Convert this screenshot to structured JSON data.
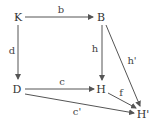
{
  "diagram": {
    "type": "commutative-diagram",
    "nodes": [
      {
        "id": "K",
        "label": "K"
      },
      {
        "id": "B",
        "label": "B"
      },
      {
        "id": "D",
        "label": "D"
      },
      {
        "id": "H",
        "label": "H"
      },
      {
        "id": "H_prime",
        "label": "H'"
      }
    ],
    "edges": [
      {
        "from": "K",
        "to": "B",
        "label": "b"
      },
      {
        "from": "K",
        "to": "D",
        "label": "d"
      },
      {
        "from": "B",
        "to": "H",
        "label": "h"
      },
      {
        "from": "B",
        "to": "H'",
        "label": "h'"
      },
      {
        "from": "D",
        "to": "H",
        "label": "c"
      },
      {
        "from": "H",
        "to": "H'",
        "label": "f"
      },
      {
        "from": "D",
        "to": "H'",
        "label": "c'"
      }
    ],
    "colors": {
      "line": "#555555",
      "text": "#333333"
    }
  }
}
